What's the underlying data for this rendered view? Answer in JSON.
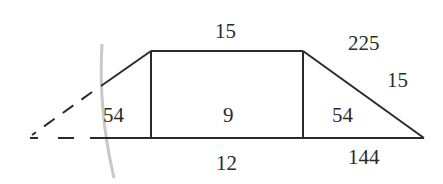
{
  "diagram": {
    "type": "trapezoid-area-decomposition",
    "colors": {
      "line": "#2a2a2a",
      "text": "#2a2a2a",
      "arc": "#c8c8c8",
      "background": "#ffffff"
    },
    "labels": {
      "top_edge": "15",
      "bottom_middle": "12",
      "center_rect": "9",
      "left_triangle": "54",
      "right_triangle": "54",
      "right_square_area": "225",
      "right_hypotenuse": "15",
      "right_bottom": "144"
    }
  }
}
